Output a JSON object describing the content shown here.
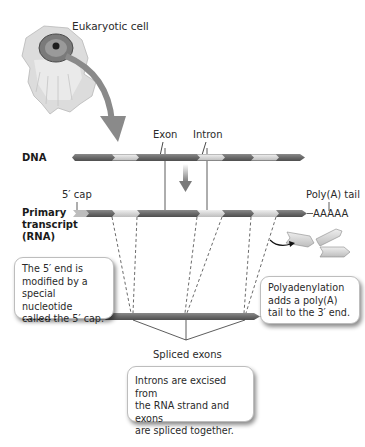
{
  "title_cell": "Eukaryotic cell",
  "labels": {
    "exon": "Exon",
    "intron": "Intron",
    "dna": "DNA",
    "five_cap": "5′ cap",
    "poly_a_tail": "Poly(A) tail",
    "primary_line1": "Primary",
    "primary_line2": "transcript",
    "primary_line3": "(RNA)",
    "mrna": "mRNA",
    "poly_a_primary": "AAAAA",
    "poly_a_mrna": "AAAAA",
    "spliced_exons": "Spliced exons"
  },
  "callouts": {
    "five_cap": [
      "The 5′ end is",
      "modified by a",
      "special nucleotide",
      "called the 5′ cap."
    ],
    "polyadenylation": [
      "Polyadenylation",
      "adds a poly(A)",
      "tail to the 3′ end."
    ],
    "splicing": [
      "Introns are excised from",
      "the RNA strand and exons",
      "are spliced together."
    ]
  },
  "colors": {
    "exon": "#6f6f6f",
    "intron": "#d4d4d4",
    "cap": "#bdbdbd",
    "arrow": "#8a8a8a",
    "cell_outer": "#d9d9d9",
    "nucleus": "#5a5a5a"
  }
}
